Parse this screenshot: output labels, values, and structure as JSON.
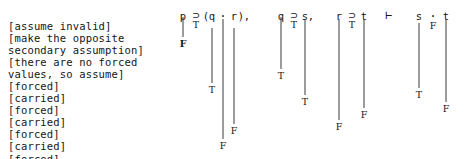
{
  "annotations": {
    "lines": [
      "[assume invalid]",
      "[make the opposite",
      "secondary assumption]",
      "[there are no forced",
      "values, so assume]",
      "[forced]",
      "[carried]",
      "[forced]",
      "[carried]",
      "[forced]",
      "[carried]",
      "[forced]"
    ]
  },
  "argument": {
    "text": "p ⊃ (q · r),   q ⊃ s,   r ⊃ t  ⊢  s · t",
    "premises": [
      "p ⊃ (q · r)",
      "q ⊃ s",
      "r ⊃ t"
    ],
    "turnstile": "⊢",
    "conclusion": "s · t"
  },
  "tokens": [
    {
      "name": "p",
      "text": "p",
      "x": 183,
      "y": 11,
      "kind": "atom"
    },
    {
      "name": "horseshoe-1",
      "text": "⊃",
      "x": 196,
      "y": 10,
      "kind": "op"
    },
    {
      "name": "lparen",
      "text": "(",
      "x": 206,
      "y": 11,
      "kind": "punct"
    },
    {
      "name": "q",
      "text": "q",
      "x": 212,
      "y": 11,
      "kind": "atom"
    },
    {
      "name": "middot-1",
      "text": "·",
      "x": 223,
      "y": 11,
      "kind": "op"
    },
    {
      "name": "r",
      "text": "r",
      "x": 234,
      "y": 11,
      "kind": "atom"
    },
    {
      "name": "rparen",
      "text": ")",
      "x": 241,
      "y": 11,
      "kind": "punct"
    },
    {
      "name": "comma-1",
      "text": ",",
      "x": 247,
      "y": 11,
      "kind": "punct"
    },
    {
      "name": "q-2",
      "text": "q",
      "x": 281,
      "y": 11,
      "kind": "atom"
    },
    {
      "name": "horseshoe-2",
      "text": "⊃",
      "x": 294,
      "y": 10,
      "kind": "op"
    },
    {
      "name": "s",
      "text": "s",
      "x": 305,
      "y": 11,
      "kind": "atom"
    },
    {
      "name": "comma-2",
      "text": ",",
      "x": 311,
      "y": 11,
      "kind": "punct"
    },
    {
      "name": "r-2",
      "text": "r",
      "x": 339,
      "y": 11,
      "kind": "atom"
    },
    {
      "name": "horseshoe-3",
      "text": "⊃",
      "x": 352,
      "y": 10,
      "kind": "op"
    },
    {
      "name": "t",
      "text": "t",
      "x": 364,
      "y": 11,
      "kind": "atom"
    },
    {
      "name": "turnstile",
      "text": "⊢",
      "x": 389,
      "y": 10,
      "kind": "op"
    },
    {
      "name": "s-2",
      "text": "s",
      "x": 419,
      "y": 11,
      "kind": "atom"
    },
    {
      "name": "middot-2",
      "text": "·",
      "x": 433,
      "y": 11,
      "kind": "op"
    },
    {
      "name": "t-2",
      "text": "t",
      "x": 446,
      "y": 11,
      "kind": "atom"
    }
  ],
  "assignments": [
    {
      "name": "value-p",
      "under": "p",
      "value": "F",
      "bold": true,
      "x": 183,
      "line_top": 17,
      "line_bottom": 37,
      "label_y": 39
    },
    {
      "name": "value-horseshoe-1",
      "under": "horseshoe-1",
      "value": "T",
      "bold": false,
      "x": 196,
      "line_top": 0,
      "line_bottom": 0,
      "label_y": 20
    },
    {
      "name": "value-q",
      "under": "q",
      "value": "T",
      "bold": false,
      "x": 212,
      "line_top": 28,
      "line_bottom": 83,
      "label_y": 85
    },
    {
      "name": "value-middot-1",
      "under": "middot-1",
      "value": "F",
      "bold": false,
      "x": 223,
      "line_top": 19,
      "line_bottom": 139,
      "label_y": 141
    },
    {
      "name": "value-r",
      "under": "r",
      "value": "F",
      "bold": false,
      "x": 234,
      "line_top": 28,
      "line_bottom": 124,
      "label_y": 126
    },
    {
      "name": "value-q-2",
      "under": "q-2",
      "value": "T",
      "bold": false,
      "x": 281,
      "line_top": 17,
      "line_bottom": 69,
      "label_y": 71
    },
    {
      "name": "value-horseshoe-2",
      "under": "horseshoe-2",
      "value": "T",
      "bold": false,
      "x": 294,
      "line_top": 0,
      "line_bottom": 0,
      "label_y": 20
    },
    {
      "name": "value-s",
      "under": "s",
      "value": "T",
      "bold": false,
      "x": 305,
      "line_top": 19,
      "line_bottom": 95,
      "label_y": 97
    },
    {
      "name": "value-r-2",
      "under": "r-2",
      "value": "F",
      "bold": false,
      "x": 339,
      "line_top": 19,
      "line_bottom": 120,
      "label_y": 122
    },
    {
      "name": "value-horseshoe-3",
      "under": "horseshoe-3",
      "value": "T",
      "bold": false,
      "x": 352,
      "line_top": 0,
      "line_bottom": 0,
      "label_y": 20
    },
    {
      "name": "value-t",
      "under": "t",
      "value": "F",
      "bold": false,
      "x": 364,
      "line_top": 19,
      "line_bottom": 108,
      "label_y": 110
    },
    {
      "name": "value-s-2",
      "under": "s-2",
      "value": "T",
      "bold": false,
      "x": 419,
      "line_top": 23,
      "line_bottom": 88,
      "label_y": 90
    },
    {
      "name": "value-middot-2",
      "under": "middot-2",
      "value": "F",
      "bold": false,
      "x": 433,
      "line_top": 0,
      "line_bottom": 0,
      "label_y": 21
    },
    {
      "name": "value-t-2",
      "under": "t-2",
      "value": "F",
      "bold": false,
      "x": 446,
      "line_top": 19,
      "line_bottom": 102,
      "label_y": 104
    }
  ],
  "colors": {
    "background": "#ffffff",
    "text": "#161616",
    "rule_line": "#3a3a3a"
  }
}
